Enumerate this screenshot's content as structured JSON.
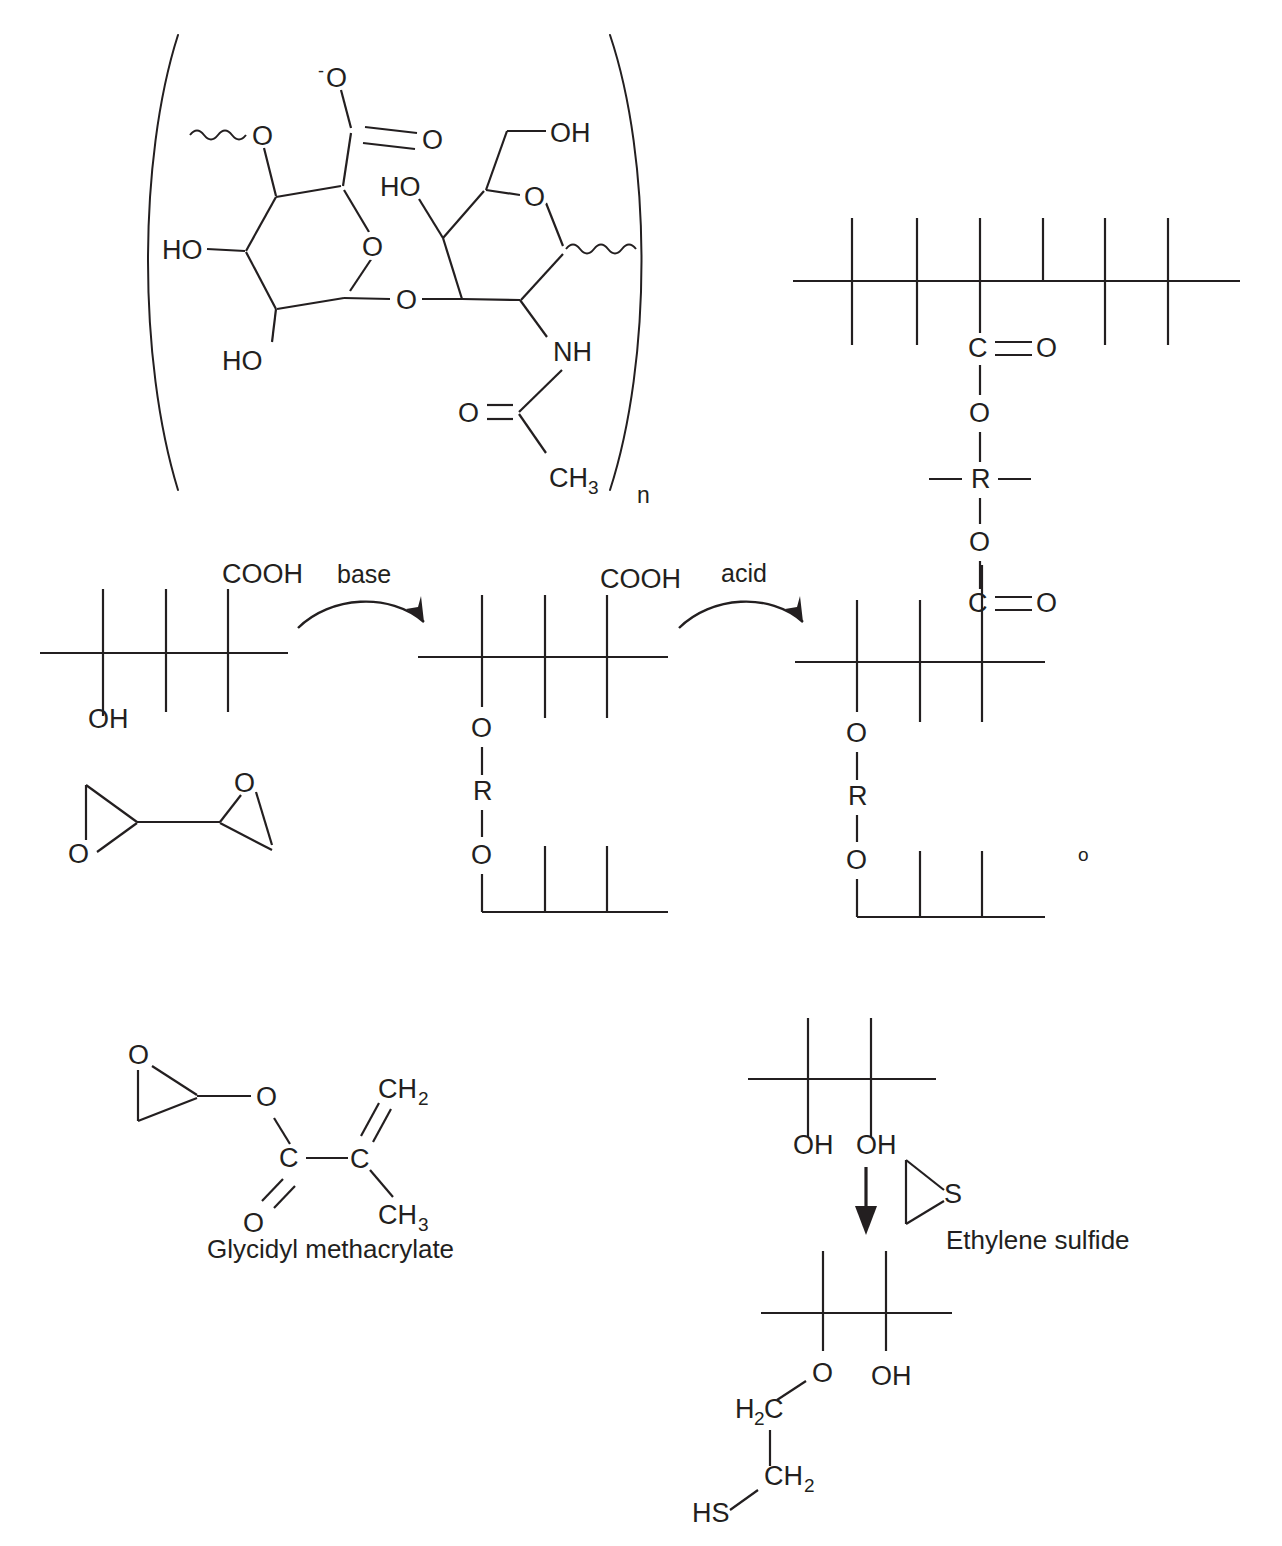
{
  "figure": {
    "kind": "chemistry-reaction-scheme",
    "background_color": "#ffffff",
    "ink_color": "#231f20"
  },
  "hyaluronic_acid": {
    "name": "Hyaluronic acid repeating disaccharide unit",
    "repeat_subscript": "n",
    "glucuronic_acid_ring": {
      "carboxylate_oxide": "O",
      "carboxylate_charge": "-",
      "carboxyl_double_bond_oxygen": "O",
      "ring_oxygen": "O",
      "glycosidic_oxygen_left": "O",
      "hydroxyl_left": "HO",
      "hydroxyl_bottom": "HO"
    },
    "n_acetylglucosamine_ring": {
      "primary_hydroxyl": "OH",
      "secondary_hydroxyl": "HO",
      "ring_oxygen": "O",
      "linking_oxygen": "O",
      "amide_nitrogen": "NH",
      "amide_oxygen": "O",
      "acetyl_methyl": "CH",
      "acetyl_methyl_sub": "3"
    }
  },
  "crosslinked_polymer": {
    "name": "Diester crosslinked polymer network",
    "upper_carbonyl_c": "C",
    "upper_carbonyl_o": "O",
    "upper_ester_o": "O",
    "spacer": "R",
    "lower_ester_o": "O",
    "lower_carbonyl_c": "C",
    "lower_carbonyl_o": "O"
  },
  "reaction_scheme": {
    "step1_label": "base",
    "step2_label": "acid",
    "reactant": {
      "side_group_top": "COOH",
      "side_group_bottom": "OH"
    },
    "diepoxide": {
      "epoxide_oxygen_left": "O",
      "epoxide_oxygen_right": "O"
    },
    "intermediate": {
      "side_group_top": "COOH",
      "ether_o_upper": "O",
      "spacer": "R",
      "ether_o_lower": "O"
    },
    "product": {
      "carbonyl_c": "C",
      "carbonyl_o": "O",
      "ester_o_upper": "O",
      "spacer": "R",
      "ester_o_lower": "O",
      "stray_marker": "o"
    }
  },
  "glycidyl_methacrylate": {
    "label": "Glycidyl methacrylate",
    "epoxide_oxygen": "O",
    "ester_oxygen": "O",
    "carbonyl_carbon": "C",
    "carbonyl_oxygen": "O",
    "vinyl_carbon": "C",
    "methylene": "CH",
    "methylene_sub": "2",
    "methyl": "CH",
    "methyl_sub": "3"
  },
  "ethylene_sulfide_reaction": {
    "reagent_label": "Ethylene sulfide",
    "reagent_sulfur": "S",
    "reactant": {
      "hydroxyl_left": "OH",
      "hydroxyl_right": "OH"
    },
    "product": {
      "ether_oxygen": "O",
      "hydroxyl": "OH",
      "methylene_top": "H",
      "methylene_top_sub": "2",
      "methylene_top_tail": "C",
      "methylene_bottom": "CH",
      "methylene_bottom_sub": "2",
      "thiol": "HS"
    }
  },
  "page_top_fragment": {
    "text": ""
  }
}
